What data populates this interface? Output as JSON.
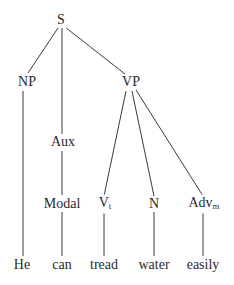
{
  "tree": {
    "nodes": {
      "S": {
        "label": "S"
      },
      "NP": {
        "label": "NP"
      },
      "VP": {
        "label": "VP"
      },
      "Aux": {
        "label": "Aux"
      },
      "Modal": {
        "label": "Modal"
      },
      "Vt": {
        "label": "V",
        "sub": "t"
      },
      "N": {
        "label": "N"
      },
      "Advm": {
        "label": "Adv",
        "sub": "m"
      },
      "He": {
        "label": "He"
      },
      "can": {
        "label": "can"
      },
      "tread": {
        "label": "tread"
      },
      "water": {
        "label": "water"
      },
      "easily": {
        "label": "easily"
      }
    },
    "edges": [
      [
        "S",
        "NP"
      ],
      [
        "S",
        "Aux"
      ],
      [
        "S",
        "VP"
      ],
      [
        "NP",
        "He"
      ],
      [
        "Aux",
        "Modal"
      ],
      [
        "Modal",
        "can"
      ],
      [
        "VP",
        "Vt"
      ],
      [
        "VP",
        "N"
      ],
      [
        "VP",
        "Advm"
      ],
      [
        "Vt",
        "tread"
      ],
      [
        "N",
        "water"
      ],
      [
        "Advm",
        "easily"
      ]
    ]
  }
}
